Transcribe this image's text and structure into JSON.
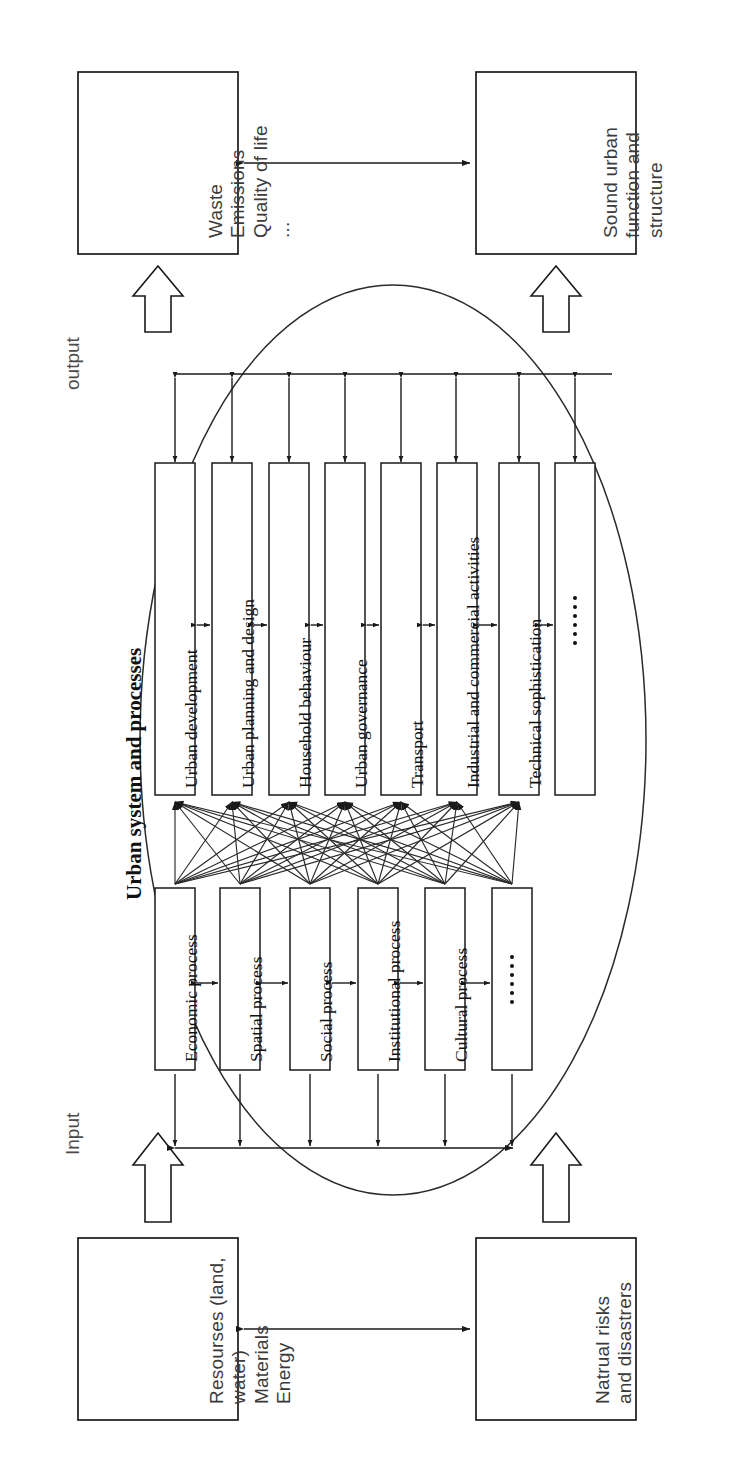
{
  "figure": {
    "type": "diagram",
    "subtype": "systems-flow-diagram",
    "orientation": "rotated-90-ccw",
    "title": "Urban system and processes",
    "io_labels": {
      "input": "Input",
      "output": "output"
    }
  },
  "corner_boxes": {
    "output_left": {
      "name": "outputs-emissions-box",
      "lines": [
        "Waste",
        "Emissions",
        "Quality of life"
      ],
      "ellipsis": "..."
    },
    "output_right": {
      "name": "outputs-urban-function-box",
      "lines": [
        "Sound urban",
        "function and",
        "structure"
      ],
      "ellipsis": ""
    },
    "input_left": {
      "name": "inputs-resources-box",
      "lines": [
        "Resourses (land,",
        "water)",
        "Materials",
        "Energy"
      ],
      "ellipsis": ""
    },
    "input_right": {
      "name": "inputs-risks-box",
      "lines": [
        "Natrual risks",
        "and disastrers"
      ],
      "ellipsis": ""
    }
  },
  "function_boxes": [
    {
      "label": "Urban development"
    },
    {
      "label": "Urban planning and design"
    },
    {
      "label": "Household behaviour"
    },
    {
      "label": "Urban governance"
    },
    {
      "label": "Transport"
    },
    {
      "label": "Industrial and commercial activities"
    },
    {
      "label": "Technical sophistication"
    },
    {
      "label": ""
    }
  ],
  "process_boxes": [
    {
      "label": "Economic process"
    },
    {
      "label": "Spatial process"
    },
    {
      "label": "Social process"
    },
    {
      "label": "Institutional process"
    },
    {
      "label": "Cultural process"
    },
    {
      "label": ""
    }
  ],
  "style": {
    "stroke": "#1a1a1a",
    "background": "#ffffff",
    "box_fill": "#ffffff",
    "ellipse_stroke": "#2b2b2b"
  }
}
